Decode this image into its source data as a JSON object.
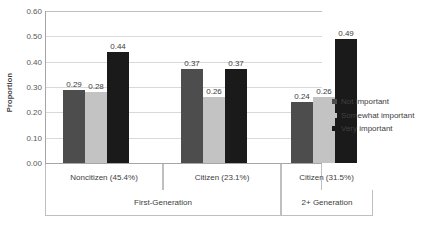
{
  "chart_data": {
    "type": "bar",
    "title": "",
    "xlabel": "",
    "ylabel": "Proportion",
    "ylim": [
      0,
      0.6
    ],
    "ytick_step": 0.1,
    "ytick_labels": [
      "0.60",
      "0.50",
      "0.40",
      "0.30",
      "0.20",
      "0.10",
      "0.00"
    ],
    "ytick_values": [
      0.6,
      0.5,
      0.4,
      0.3,
      0.2,
      0.1,
      0.0
    ],
    "grid": true,
    "legend_position": "right",
    "categories": [
      "Noncitizen (45.4%)",
      "Citizen (23.1%)",
      "Citizen (31.5%)"
    ],
    "supergroups": [
      {
        "label": "First-Generation",
        "categories": [
          "Noncitizen (45.4%)",
          "Citizen (23.1%)"
        ]
      },
      {
        "label": "2+ Generation",
        "categories": [
          "Citizen (31.5%)"
        ]
      }
    ],
    "series": [
      {
        "name": "Not important",
        "color": "#4d4d4d",
        "values": [
          0.29,
          0.37,
          0.24
        ],
        "labels": [
          "0.29",
          "0.37",
          "0.24"
        ]
      },
      {
        "name": "Somewhat important",
        "color": "#c3c3c3",
        "values": [
          0.28,
          0.26,
          0.26
        ],
        "labels": [
          "0.28",
          "0.26",
          "0.26"
        ]
      },
      {
        "name": "Very important",
        "color": "#1a1a1a",
        "values": [
          0.44,
          0.37,
          0.49
        ],
        "labels": [
          "0.44",
          "0.37",
          "0.49"
        ]
      }
    ]
  },
  "legend": {
    "items": [
      {
        "label": "Not important",
        "color": "#4d4d4d"
      },
      {
        "label": "Somewhat important",
        "color": "#c3c3c3"
      },
      {
        "label": "Very important",
        "color": "#1a1a1a"
      }
    ]
  }
}
